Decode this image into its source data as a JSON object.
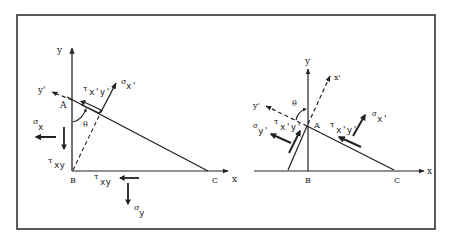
{
  "figure": {
    "left_panel": {
      "axis_labels": {
        "y": "y",
        "x": "x",
        "y_prime": "y'"
      },
      "points": {
        "A": "A",
        "B": "B",
        "C": "C"
      },
      "angle": "θ",
      "stresses": {
        "sigma_x_prime": {
          "sym": "σ",
          "sub": "x'"
        },
        "tau_xy_prime": {
          "sym": "τ",
          "sub": "x'y'"
        },
        "sigma_x": {
          "sym": "σ",
          "sub": "x"
        },
        "tau_xy_left": {
          "sym": "τ",
          "sub": "xy"
        },
        "tau_xy_bottom": {
          "sym": "τ",
          "sub": "xy"
        },
        "sigma_y": {
          "sym": "σ",
          "sub": "y"
        }
      }
    },
    "right_panel": {
      "axis_labels": {
        "y": "y",
        "x": "x",
        "x_prime": "x'",
        "y_prime": "y'"
      },
      "points": {
        "A": "A",
        "B": "B",
        "C": "C"
      },
      "angle": "θ",
      "stresses": {
        "sigma_y_prime": {
          "sym": "σ",
          "sub": "y'"
        },
        "tau_xy_prime_left": {
          "sym": "τ",
          "sub": "x'y'"
        },
        "tau_xy_prime_right": {
          "sym": "τ",
          "sub": "x'y'"
        },
        "sigma_x_prime": {
          "sym": "σ",
          "sub": "x'"
        }
      }
    },
    "colors": {
      "ink": "#222222",
      "background": "#ffffff",
      "frame": "#333333"
    }
  }
}
